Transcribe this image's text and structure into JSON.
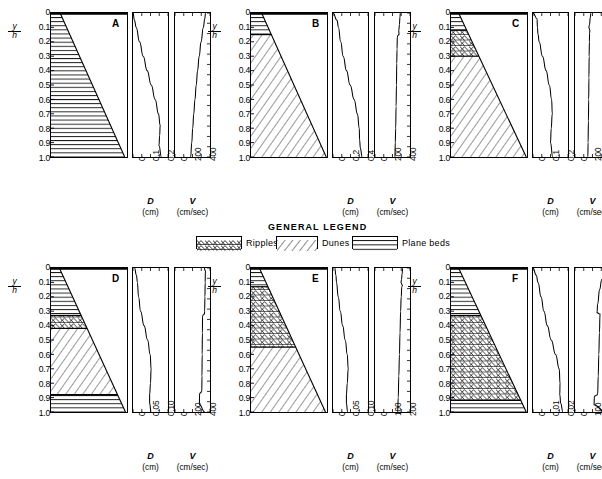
{
  "figure": {
    "y_axis_label_numerator": "y",
    "y_axis_label_denominator": "h",
    "y_ticks": [
      "0",
      "0.1",
      "0.2",
      "0.3",
      "0.4",
      "0.5",
      "0.6",
      "0.7",
      "0.8",
      "0.9",
      "1.0"
    ]
  },
  "legend": {
    "title": "GENERAL LEGEND",
    "items": [
      {
        "label": "Ripples",
        "pattern": "ripples"
      },
      {
        "label": "Dunes",
        "pattern": "dunes"
      },
      {
        "label": "Plane beds",
        "pattern": "plane-beds"
      }
    ]
  },
  "chart_data": {
    "type": "line",
    "title": "GENERAL LEGEND",
    "shared_y": {
      "label": "y/h",
      "ticks": [
        0,
        0.1,
        0.2,
        0.3,
        0.4,
        0.5,
        0.6,
        0.7,
        0.8,
        0.9,
        1.0
      ],
      "ylim": [
        0,
        1.0
      ],
      "direction": "inverted"
    },
    "panels": [
      {
        "letter": "A",
        "column_top_width_frac": 0.12,
        "column_bottom_width_frac": 0.97,
        "beds": [
          {
            "type": "plane-beds",
            "from": 0.0,
            "to": 1.0
          }
        ],
        "D": {
          "label": "D",
          "unit": "(cm)",
          "ticks": [
            "0",
            "0.1",
            "0.2"
          ],
          "tick_values": [
            0,
            0.1,
            0.2
          ],
          "xlim": [
            0,
            0.24
          ],
          "profile_y": [
            0.0,
            0.05,
            0.1,
            0.2,
            0.3,
            0.4,
            0.5,
            0.6,
            0.7,
            0.78,
            0.85,
            0.92,
            1.0
          ],
          "profile_x": [
            0.0,
            0.01,
            0.022,
            0.045,
            0.07,
            0.097,
            0.125,
            0.152,
            0.175,
            0.186,
            0.183,
            0.178,
            0.195
          ]
        },
        "V": {
          "label": "V",
          "unit": "(cm/sec)",
          "ticks": [
            "0",
            "200",
            "400"
          ],
          "tick_values": [
            0,
            200,
            400
          ],
          "xlim": [
            0,
            470
          ],
          "profile_y": [
            0.0,
            0.04,
            0.1,
            0.2,
            0.3,
            0.4,
            0.5,
            0.6,
            0.7,
            0.8,
            0.9,
            1.0
          ],
          "profile_x": [
            410,
            400,
            380,
            350,
            325,
            303,
            285,
            268,
            252,
            238,
            225,
            210
          ]
        }
      },
      {
        "letter": "B",
        "column_top_width_frac": 0.14,
        "column_bottom_width_frac": 0.99,
        "beds": [
          {
            "type": "plane-beds",
            "from": 0.0,
            "to": 0.15
          },
          {
            "type": "dunes",
            "from": 0.15,
            "to": 1.0
          }
        ],
        "D": {
          "label": "D",
          "unit": "(cm)",
          "ticks": [
            "0",
            "0.2",
            "0.4"
          ],
          "tick_values": [
            0,
            0.2,
            0.4
          ],
          "xlim": [
            0,
            0.48
          ],
          "profile_y": [
            0.0,
            0.05,
            0.1,
            0.2,
            0.3,
            0.4,
            0.5,
            0.6,
            0.7,
            0.8,
            0.88,
            0.94,
            1.0
          ],
          "profile_x": [
            0.0,
            0.055,
            0.075,
            0.105,
            0.14,
            0.185,
            0.235,
            0.29,
            0.335,
            0.36,
            0.365,
            0.375,
            0.4
          ]
        },
        "V": {
          "label": "V",
          "unit": "(cm/sec)",
          "ticks": [
            "0",
            "200",
            "400"
          ],
          "tick_values": [
            0,
            200,
            400
          ],
          "xlim": [
            0,
            470
          ],
          "profile_y": [
            0.0,
            0.03,
            0.08,
            0.12,
            0.15,
            0.16,
            0.25,
            0.35,
            0.5,
            0.65,
            0.8,
            0.9,
            1.0
          ],
          "profile_x": [
            340,
            335,
            328,
            320,
            322,
            300,
            296,
            292,
            288,
            283,
            278,
            272,
            268
          ]
        }
      },
      {
        "letter": "C",
        "column_top_width_frac": 0.1,
        "column_bottom_width_frac": 0.99,
        "beds": [
          {
            "type": "plane-beds",
            "from": 0.0,
            "to": 0.12
          },
          {
            "type": "ripples",
            "from": 0.12,
            "to": 0.3
          },
          {
            "type": "dunes",
            "from": 0.3,
            "to": 1.0
          }
        ],
        "D": {
          "label": "D",
          "unit": "(cm)",
          "ticks": [
            "0",
            "0.1",
            "0.2"
          ],
          "tick_values": [
            0,
            0.1,
            0.2
          ],
          "xlim": [
            0,
            0.24
          ],
          "profile_y": [
            0.0,
            0.04,
            0.1,
            0.15,
            0.2,
            0.3,
            0.4,
            0.5,
            0.6,
            0.7,
            0.8,
            0.9,
            1.0
          ],
          "profile_x": [
            0.0,
            0.028,
            0.03,
            0.035,
            0.042,
            0.065,
            0.09,
            0.112,
            0.128,
            0.132,
            0.125,
            0.12,
            0.135
          ]
        },
        "V": {
          "label": "V",
          "unit": "(cm/sec)",
          "ticks": [
            "0",
            "200",
            "400"
          ],
          "tick_values": [
            0,
            200,
            400
          ],
          "xlim": [
            0,
            470
          ],
          "profile_y": [
            0.0,
            0.03,
            0.08,
            0.1,
            0.12,
            0.14,
            0.2,
            0.3,
            0.45,
            0.6,
            0.75,
            0.9,
            1.0
          ],
          "profile_x": [
            215,
            205,
            195,
            185,
            200,
            196,
            193,
            190,
            187,
            184,
            180,
            176,
            172
          ]
        }
      },
      {
        "letter": "D",
        "column_top_width_frac": 0.11,
        "column_bottom_width_frac": 0.98,
        "beds": [
          {
            "type": "plane-beds",
            "from": 0.0,
            "to": 0.33
          },
          {
            "type": "ripples",
            "from": 0.33,
            "to": 0.42
          },
          {
            "type": "dunes",
            "from": 0.42,
            "to": 0.88
          },
          {
            "type": "plane-beds",
            "from": 0.88,
            "to": 1.0
          }
        ],
        "D": {
          "label": "D",
          "unit": "(cm)",
          "ticks": [
            "0",
            "0.05",
            "0.10"
          ],
          "tick_values": [
            0,
            0.05,
            0.1
          ],
          "xlim": [
            0,
            0.12
          ],
          "profile_y": [
            0.0,
            0.05,
            0.1,
            0.2,
            0.3,
            0.4,
            0.5,
            0.6,
            0.7,
            0.8,
            0.88,
            0.94,
            1.0
          ],
          "profile_x": [
            0.005,
            0.012,
            0.015,
            0.019,
            0.026,
            0.038,
            0.05,
            0.059,
            0.062,
            0.06,
            0.057,
            0.057,
            0.062
          ]
        },
        "V": {
          "label": "V",
          "unit": "(cm/sec)",
          "ticks": [
            "0",
            "200",
            "400"
          ],
          "tick_values": [
            0,
            200,
            400
          ],
          "xlim": [
            0,
            470
          ],
          "profile_y": [
            0.0,
            0.02,
            0.1,
            0.2,
            0.3,
            0.32,
            0.33,
            0.45,
            0.6,
            0.75,
            0.86,
            0.87,
            0.95,
            1.0
          ],
          "profile_x": [
            390,
            408,
            405,
            402,
            398,
            396,
            370,
            368,
            365,
            362,
            360,
            330,
            328,
            400
          ]
        }
      },
      {
        "letter": "E",
        "column_top_width_frac": 0.11,
        "column_bottom_width_frac": 0.98,
        "beds": [
          {
            "type": "plane-beds",
            "from": 0.0,
            "to": 0.13
          },
          {
            "type": "ripples",
            "from": 0.13,
            "to": 0.55
          },
          {
            "type": "dunes",
            "from": 0.55,
            "to": 1.0
          }
        ],
        "D": {
          "label": "D",
          "unit": "(cm)",
          "ticks": [
            "0",
            "0.05",
            "0.10"
          ],
          "tick_values": [
            0,
            0.05,
            0.1
          ],
          "xlim": [
            0,
            0.12
          ],
          "profile_y": [
            0.0,
            0.05,
            0.1,
            0.2,
            0.3,
            0.4,
            0.5,
            0.6,
            0.7,
            0.8,
            0.88,
            0.94,
            1.0
          ],
          "profile_x": [
            0.006,
            0.01,
            0.012,
            0.018,
            0.025,
            0.033,
            0.042,
            0.049,
            0.052,
            0.049,
            0.046,
            0.046,
            0.05
          ]
        },
        "V": {
          "label": "V",
          "unit": "(cm/sec)",
          "ticks": [
            "0",
            "100",
            "200"
          ],
          "tick_values": [
            0,
            100,
            200
          ],
          "xlim": [
            0,
            235
          ],
          "profile_y": [
            0.0,
            0.04,
            0.08,
            0.1,
            0.12,
            0.13,
            0.2,
            0.3,
            0.45,
            0.6,
            0.75,
            0.9,
            1.0
          ],
          "profile_x": [
            186,
            182,
            178,
            174,
            184,
            180,
            176,
            172,
            168,
            164,
            160,
            156,
            152
          ]
        }
      },
      {
        "letter": "F",
        "column_top_width_frac": 0.1,
        "column_bottom_width_frac": 0.99,
        "beds": [
          {
            "type": "plane-beds",
            "from": 0.0,
            "to": 0.33
          },
          {
            "type": "ripples",
            "from": 0.33,
            "to": 0.92
          },
          {
            "type": "plane-beds",
            "from": 0.92,
            "to": 1.0
          }
        ],
        "D": {
          "label": "D",
          "unit": "(cm)",
          "ticks": [
            "0",
            "0.01",
            "0.02"
          ],
          "tick_values": [
            0,
            0.01,
            0.02
          ],
          "xlim": [
            0,
            0.024
          ],
          "profile_y": [
            0.0,
            0.05,
            0.1,
            0.2,
            0.3,
            0.4,
            0.5,
            0.6,
            0.7,
            0.8,
            0.88,
            0.94,
            1.0
          ],
          "profile_x": [
            0.0,
            0.0022,
            0.0035,
            0.0055,
            0.0075,
            0.0098,
            0.0125,
            0.0155,
            0.018,
            0.0185,
            0.0184,
            0.019,
            0.0205
          ]
        },
        "V": {
          "label": "V",
          "unit": "(cm/sec)",
          "ticks": [
            "0",
            "100",
            "200"
          ],
          "tick_values": [
            0,
            100,
            200
          ],
          "xlim": [
            0,
            235
          ],
          "profile_y": [
            0.0,
            0.03,
            0.08,
            0.15,
            0.25,
            0.31,
            0.32,
            0.45,
            0.6,
            0.75,
            0.88,
            0.89,
            0.95,
            1.0
          ],
          "profile_x": [
            215,
            205,
            180,
            165,
            152,
            148,
            168,
            164,
            160,
            156,
            152,
            130,
            128,
            200
          ]
        }
      }
    ]
  }
}
